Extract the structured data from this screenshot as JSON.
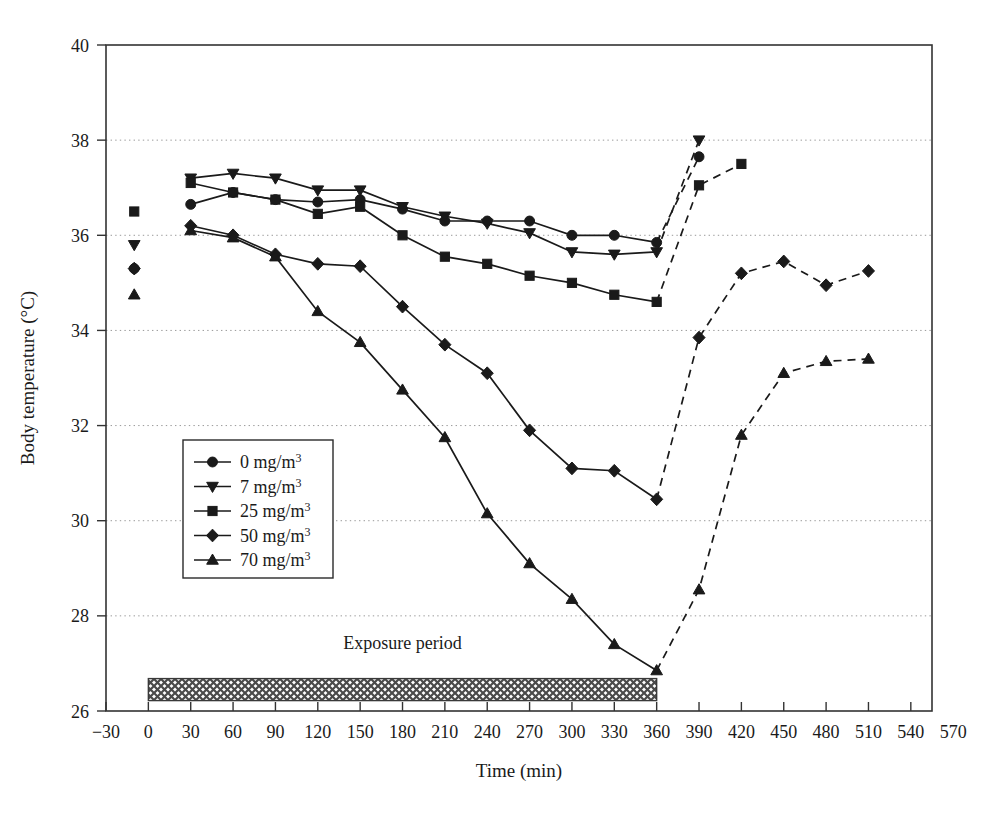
{
  "figure": {
    "background": "#ffffff",
    "frame_color": "#333333",
    "grid_color": "#9a9a9a",
    "series_color": "#1a1a1a"
  },
  "chart_data": {
    "type": "line",
    "title": "",
    "xlabel": "Time (min)",
    "ylabel": "Body temperature (°C)",
    "xlim": [
      -30,
      555
    ],
    "ylim": [
      26,
      40
    ],
    "xticks": [
      -30,
      0,
      30,
      60,
      90,
      120,
      150,
      180,
      210,
      240,
      270,
      300,
      330,
      360,
      390,
      420,
      450,
      480,
      510,
      540,
      570
    ],
    "xticklabels": [
      "−30",
      "0",
      "30",
      "60",
      "90",
      "120",
      "150",
      "180",
      "210",
      "240",
      "270",
      "300",
      "330",
      "360",
      "390",
      "420",
      "450",
      "480",
      "510",
      "540",
      "570"
    ],
    "yticks": [
      26,
      28,
      30,
      32,
      34,
      36,
      38,
      40
    ],
    "yticklabels": [
      "26",
      "28",
      "30",
      "32",
      "34",
      "36",
      "38",
      "40"
    ],
    "grid": "horizontal-dotted",
    "legend_position": "inner-left",
    "series": [
      {
        "name": "0 mg/m3",
        "label": "0 mg/m",
        "label_sup": "3",
        "marker": "circle",
        "baseline": {
          "x": -10,
          "y": 35.3
        },
        "exposure_x": [
          30,
          60,
          90,
          120,
          150,
          180,
          210,
          240,
          270,
          300,
          330,
          360
        ],
        "exposure_y": [
          36.65,
          36.9,
          36.75,
          36.7,
          36.75,
          36.55,
          36.3,
          36.3,
          36.3,
          36.0,
          36.0,
          35.85
        ],
        "recovery_x": [
          360,
          390
        ],
        "recovery_y": [
          35.85,
          37.65
        ]
      },
      {
        "name": "7 mg/m3",
        "label": "7 mg/m",
        "label_sup": "3",
        "marker": "triangle-down",
        "baseline": {
          "x": -10,
          "y": 35.8
        },
        "exposure_x": [
          30,
          60,
          90,
          120,
          150,
          180,
          210,
          240,
          270,
          300,
          330,
          360
        ],
        "exposure_y": [
          37.2,
          37.3,
          37.2,
          36.95,
          36.95,
          36.6,
          36.4,
          36.25,
          36.05,
          35.65,
          35.6,
          35.65
        ],
        "recovery_x": [
          360,
          390
        ],
        "recovery_y": [
          35.65,
          38.0
        ]
      },
      {
        "name": "25 mg/m3",
        "label": "25 mg/m",
        "label_sup": "3",
        "marker": "square",
        "baseline": {
          "x": -10,
          "y": 36.5
        },
        "exposure_x": [
          30,
          60,
          90,
          120,
          150,
          180,
          210,
          240,
          270,
          300,
          330,
          360
        ],
        "exposure_y": [
          37.1,
          36.9,
          36.75,
          36.45,
          36.6,
          36.0,
          35.55,
          35.4,
          35.15,
          35.0,
          34.75,
          34.6
        ],
        "recovery_x": [
          360,
          390,
          420
        ],
        "recovery_y": [
          34.6,
          37.05,
          37.5
        ]
      },
      {
        "name": "50 mg/m3",
        "label": "50 mg/m",
        "label_sup": "3",
        "marker": "diamond",
        "baseline": {
          "x": -10,
          "y": 35.3
        },
        "exposure_x": [
          30,
          60,
          90,
          120,
          150,
          180,
          210,
          240,
          270,
          300,
          330,
          360
        ],
        "exposure_y": [
          36.2,
          36.0,
          35.6,
          35.4,
          35.35,
          34.5,
          33.7,
          33.1,
          31.9,
          31.1,
          31.05,
          30.45
        ],
        "recovery_x": [
          360,
          390,
          420,
          450,
          480,
          510
        ],
        "recovery_y": [
          30.45,
          33.85,
          35.2,
          35.45,
          34.95,
          35.25
        ]
      },
      {
        "name": "70 mg/m3",
        "label": "70 mg/m",
        "label_sup": "3",
        "marker": "triangle-up",
        "baseline": {
          "x": -10,
          "y": 34.75
        },
        "exposure_x": [
          30,
          60,
          90,
          120,
          150,
          180,
          210,
          240,
          270,
          300,
          330,
          360
        ],
        "exposure_y": [
          36.1,
          35.95,
          35.55,
          34.4,
          33.75,
          32.75,
          31.75,
          30.15,
          29.1,
          28.35,
          27.4,
          26.85
        ],
        "recovery_x": [
          360,
          390,
          420,
          450,
          480,
          510
        ],
        "recovery_y": [
          26.85,
          28.55,
          31.8,
          33.1,
          33.35,
          33.4
        ]
      }
    ],
    "annotations": [
      {
        "name": "exposure-period",
        "text": "Exposure period",
        "x_start": 0,
        "x_end": 360,
        "y": 26.45,
        "text_x": 180,
        "text_y": 27.3
      }
    ]
  },
  "legend": {
    "items": [
      {
        "label": "0 mg/m",
        "sup": "3",
        "marker": "circle"
      },
      {
        "label": "7 mg/m",
        "sup": "3",
        "marker": "triangle-down"
      },
      {
        "label": "25 mg/m",
        "sup": "3",
        "marker": "square"
      },
      {
        "label": "50 mg/m",
        "sup": "3",
        "marker": "diamond"
      },
      {
        "label": "70 mg/m",
        "sup": "3",
        "marker": "triangle-up"
      }
    ]
  },
  "axis": {
    "x_title": "Time (min)",
    "y_title_main": "Body temperature (",
    "y_title_unit": "°C",
    "y_title_close": ")"
  }
}
